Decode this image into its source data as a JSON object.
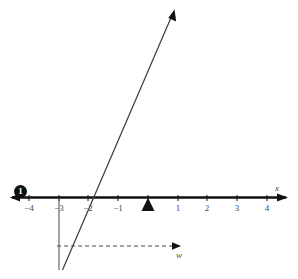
{
  "figure": {
    "type": "number-line-graph",
    "background_color": "#ffffff",
    "ink_color": "#111111",
    "label_color": "#4a4a4a"
  },
  "axes": {
    "x_axis": {
      "name": "x",
      "ticks": [
        "−4",
        "−3",
        "−2",
        "−1",
        "1",
        "2",
        "3",
        "4"
      ],
      "tick_values": [
        -4,
        -3,
        -2,
        -1,
        1,
        2,
        3,
        4
      ],
      "origin_label": "",
      "arrow_left": true,
      "arrow_right": true
    },
    "w_axis": {
      "name": "w",
      "style": "dashed",
      "arrow_right": true
    }
  },
  "markers": {
    "badge": {
      "label": "1",
      "position_value": -4,
      "shape": "filled-circle"
    },
    "origin_triangle": {
      "label": "",
      "position_value": 0,
      "shape": "filled-triangle-up"
    }
  },
  "lines": {
    "ray": {
      "crosses_x_at": -2,
      "direction": "up-right",
      "arrow_head": true
    },
    "vertical_segment": {
      "at_value": -3,
      "direction": "down"
    }
  }
}
